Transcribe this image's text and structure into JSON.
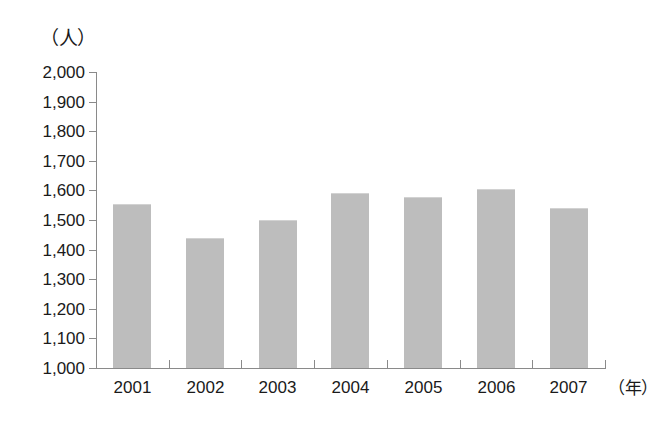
{
  "chart_data": {
    "type": "bar",
    "title": "",
    "subtitle": "",
    "xlabel": "（年）",
    "ylabel": "（人）",
    "categories": [
      "2001",
      "2002",
      "2003",
      "2004",
      "2005",
      "2006",
      "2007"
    ],
    "values": [
      1555,
      1440,
      1500,
      1592,
      1577,
      1605,
      1542
    ],
    "series": [
      {
        "name": "人数",
        "values": [
          1555,
          1440,
          1500,
          1592,
          1577,
          1605,
          1542
        ]
      }
    ],
    "ylim": [
      1000,
      2000
    ],
    "ytick_step": 100,
    "ytick_labels": [
      "2,000",
      "1,900",
      "1,800",
      "1,700",
      "1,600",
      "1,500",
      "1,400",
      "1,300",
      "1,200",
      "1,100",
      "1,000"
    ],
    "ytick_values": [
      2000,
      1900,
      1800,
      1700,
      1600,
      1500,
      1400,
      1300,
      1200,
      1100,
      1000
    ],
    "grid": false,
    "legend": null,
    "legend_position": "none",
    "annotations": [],
    "bar_color": "#bdbdbd",
    "axis_color": "#8a8a8a",
    "text_color": "#1a1a1a",
    "background_color": "#ffffff"
  }
}
